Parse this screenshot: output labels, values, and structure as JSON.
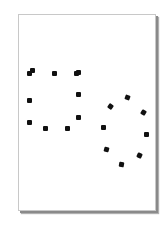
{
  "figure": {
    "colors": {
      "card_background": "#ffffff",
      "card_border": "#c8c8c8",
      "card_shadow": "#8a8a8a",
      "dot": "#111111"
    },
    "shapes": [
      {
        "name": "left-rectangle-shape",
        "dots": [
          {
            "x": 29,
            "y": 73,
            "r": 0
          },
          {
            "x": 32,
            "y": 70,
            "r": 0
          },
          {
            "x": 54,
            "y": 73,
            "r": 0
          },
          {
            "x": 76,
            "y": 73,
            "r": 0
          },
          {
            "x": 78,
            "y": 72,
            "r": 0
          },
          {
            "x": 78,
            "y": 94,
            "r": 0
          },
          {
            "x": 78,
            "y": 117,
            "r": 0
          },
          {
            "x": 67,
            "y": 128,
            "r": 0
          },
          {
            "x": 45,
            "y": 128,
            "r": 0
          },
          {
            "x": 29,
            "y": 122,
            "r": 0
          },
          {
            "x": 29,
            "y": 100,
            "r": 0
          }
        ]
      },
      {
        "name": "right-circle-shape",
        "dots": [
          {
            "x": 127,
            "y": 97,
            "r": 20
          },
          {
            "x": 143,
            "y": 112,
            "r": 30
          },
          {
            "x": 146,
            "y": 134,
            "r": 0
          },
          {
            "x": 139,
            "y": 155,
            "r": 25
          },
          {
            "x": 121,
            "y": 164,
            "r": 10
          },
          {
            "x": 106,
            "y": 149,
            "r": 15
          },
          {
            "x": 103,
            "y": 127,
            "r": 0
          },
          {
            "x": 110,
            "y": 106,
            "r": 35
          }
        ]
      }
    ]
  }
}
